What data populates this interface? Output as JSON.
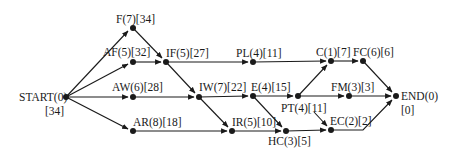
{
  "diagram": {
    "type": "activity-on-node network",
    "nodes": [
      {
        "id": "START",
        "label": "START(0)",
        "sub": "[34]",
        "x": 66,
        "y": 97
      },
      {
        "id": "F",
        "label": "F(7)[34]",
        "x": 133,
        "y": 28
      },
      {
        "id": "AF",
        "label": "AF(5)[32]",
        "x": 133,
        "y": 62
      },
      {
        "id": "AW",
        "label": "AW(6)[28]",
        "x": 133,
        "y": 97
      },
      {
        "id": "AR",
        "label": "AR(8)[18]",
        "x": 133,
        "y": 131
      },
      {
        "id": "IF",
        "label": "IF(5)[27]",
        "x": 166,
        "y": 62
      },
      {
        "id": "IW",
        "label": "IW(7)[22]",
        "x": 199,
        "y": 97
      },
      {
        "id": "IR",
        "label": "IR(5)[10]",
        "x": 232,
        "y": 131
      },
      {
        "id": "PL",
        "label": "PL(4)[11]",
        "x": 253,
        "y": 62
      },
      {
        "id": "E",
        "label": "E(4)[15]",
        "x": 253,
        "y": 96
      },
      {
        "id": "HC",
        "label": "HC(3)[5]",
        "x": 286,
        "y": 131
      },
      {
        "id": "PT",
        "label": "PT(4)[11]",
        "x": 298,
        "y": 96
      },
      {
        "id": "C",
        "label": "C(1)[7]",
        "x": 331,
        "y": 61
      },
      {
        "id": "FC",
        "label": "FC(6)[6]",
        "x": 363,
        "y": 61
      },
      {
        "id": "FM",
        "label": "FM(3)[3]",
        "x": 349,
        "y": 96
      },
      {
        "id": "EC",
        "label": "EC(2)[2]",
        "x": 331,
        "y": 130
      },
      {
        "id": "END",
        "label": "END(0)",
        "sub": "[0]",
        "x": 396,
        "y": 96
      }
    ],
    "edges": [
      [
        "START",
        "F"
      ],
      [
        "START",
        "AF"
      ],
      [
        "START",
        "AW"
      ],
      [
        "START",
        "AR"
      ],
      [
        "F",
        "IF"
      ],
      [
        "AF",
        "IF"
      ],
      [
        "F",
        "IW"
      ],
      [
        "AW",
        "IW"
      ],
      [
        "F",
        "IR"
      ],
      [
        "AR",
        "IR"
      ],
      [
        "IF",
        "PL"
      ],
      [
        "IW",
        "E"
      ],
      [
        "IR",
        "HC"
      ],
      [
        "E",
        "HC"
      ],
      [
        "E",
        "PT"
      ],
      [
        "PL",
        "C"
      ],
      [
        "PT",
        "C"
      ],
      [
        "C",
        "FC"
      ],
      [
        "PT",
        "FM"
      ],
      [
        "PT",
        "EC"
      ],
      [
        "HC",
        "EC"
      ],
      [
        "FC",
        "END"
      ],
      [
        "FM",
        "END"
      ],
      [
        "EC",
        "END"
      ]
    ]
  },
  "labels": {
    "START": "START(0)",
    "START_sub": "[34]",
    "F": "F(7)[34]",
    "AF": "AF(5)[32]",
    "AW": "AW(6)[28]",
    "AR": "AR(8)[18]",
    "IF": "IF(5)[27]",
    "IW": "IW(7)[22]",
    "IR": "IR(5)[10]",
    "PL": "PL(4)[11]",
    "E": "E(4)[15]",
    "HC": "HC(3)[5]",
    "PT": "PT(4)[11]",
    "C": "C(1)[7]",
    "FC": "FC(6)[6]",
    "FM": "FM(3)[3]",
    "EC": "EC(2)[2]",
    "END": "END(0)",
    "END_sub": "[0]"
  }
}
